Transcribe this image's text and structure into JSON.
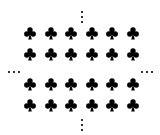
{
  "grid": {
    "rows": 4,
    "cols": 6,
    "symbol": "club-icon",
    "color": "#000000",
    "col_x": [
      24,
      45,
      65,
      86,
      106,
      127
    ],
    "row_y": [
      27,
      48,
      78,
      99
    ]
  },
  "ellipses": {
    "top": {
      "orientation": "vertical",
      "x": 81,
      "y": 11
    },
    "bottom": {
      "orientation": "vertical",
      "x": 81,
      "y": 119
    },
    "left": {
      "orientation": "horizontal",
      "x": 8,
      "y": 71
    },
    "right": {
      "orientation": "horizontal",
      "x": 141,
      "y": 71
    },
    "color": "#333333"
  }
}
